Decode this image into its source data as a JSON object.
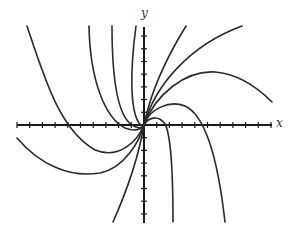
{
  "diagram": {
    "type": "direction-field-solution-curves",
    "axis_labels": {
      "x": "x",
      "y": "y"
    },
    "colors": {
      "curve": "#2a2a2a",
      "axis": "#1a1a1a",
      "background": "#ffffff"
    },
    "origin_px": [
      144,
      125
    ],
    "tick_spacing_px": 12.7,
    "x_ticks_left": 10,
    "x_ticks_right": 10,
    "y_ticks_up": 7,
    "y_ticks_down": 7,
    "curve_count": 11,
    "curves": [
      {
        "name": "upper-left-far",
        "path": "M27,26 C45,80 60,130 95,150 C120,160 138,140 144,125"
      },
      {
        "name": "upper-left-2",
        "path": "M89,26 C90,80 105,118 125,128 C138,133 142,128 144,125"
      },
      {
        "name": "upper-left-3",
        "path": "M112,26 C112,80 118,116 132,125 C140,130 143,127 144,125"
      },
      {
        "name": "upper-left-4",
        "path": "M136,26 C130,70 130,110 139,123 C142,127 143,126 144,125"
      },
      {
        "name": "lower-left-wide",
        "path": "M17,138 C40,165 70,178 100,173 C125,168 140,140 144,125"
      },
      {
        "name": "lower-line",
        "path": "M113,222 C125,195 138,160 144,125"
      },
      {
        "name": "upper-right-steep",
        "path": "M144,125 C150,95 165,60 186,26"
      },
      {
        "name": "upper-right-wide",
        "path": "M144,125 C155,85 190,45 242,26"
      },
      {
        "name": "upper-right-hump",
        "path": "M144,125 C155,95 185,70 215,72 C240,74 258,88 272,102"
      },
      {
        "name": "right-hump",
        "path": "M144,125 C150,108 170,100 185,106 C205,115 218,160 225,222"
      },
      {
        "name": "small-right-hump",
        "path": "M144,125 C148,118 158,114 165,124 C171,135 173,180 173,222"
      }
    ]
  }
}
